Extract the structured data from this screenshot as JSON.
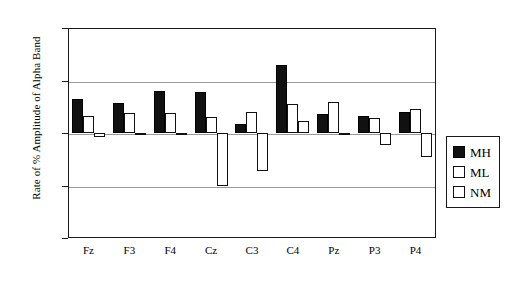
{
  "chart_data": {
    "type": "bar",
    "title": "",
    "xlabel": "",
    "ylabel": "Rate of % Amplitude of Alpha Band",
    "categories": [
      "Fz",
      "F3",
      "F4",
      "Cz",
      "C3",
      "C4",
      "Pz",
      "P3",
      "P4"
    ],
    "series": [
      {
        "name": "MH",
        "color": "#111111",
        "fill": "solid",
        "values": [
          1.065,
          1.057,
          1.08,
          1.078,
          1.018,
          1.13,
          1.036,
          1.033,
          1.04
        ]
      },
      {
        "name": "ML",
        "color": "#ffffff",
        "fill": "hollow",
        "values": [
          1.032,
          1.038,
          1.038,
          1.03,
          1.04,
          1.055,
          1.06,
          1.028,
          1.045
        ]
      },
      {
        "name": "NM",
        "color": "#ffffff",
        "fill": "hollow",
        "values": [
          0.993,
          0.997,
          0.999,
          0.9,
          0.928,
          1.022,
          0.998,
          0.978,
          0.955
        ]
      }
    ],
    "baseline": 1.0,
    "ylim": [
      0.8,
      1.2
    ],
    "ytick_labels": [
      "1.2",
      "1.1",
      "1",
      "0.9",
      "0.8"
    ],
    "ytick_values": [
      1.2,
      1.1,
      1.0,
      0.9,
      0.8
    ],
    "grid": true,
    "gridlines_at": [
      1.1,
      1.0,
      0.9
    ],
    "legend_position": "right",
    "legend_entries": [
      "MH",
      "ML",
      "NM"
    ]
  },
  "legend": {
    "items": [
      {
        "label": "MH",
        "style": "filled"
      },
      {
        "label": "ML",
        "style": "hollow"
      },
      {
        "label": "NM",
        "style": "hollow"
      }
    ]
  },
  "axis": {
    "y_title": "Rate of % Amplitude of Alpha Band"
  }
}
